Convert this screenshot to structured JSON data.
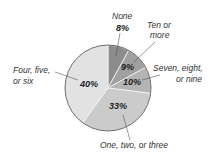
{
  "chart_data": {
    "type": "pie",
    "title": "",
    "start_angle_deg": 0,
    "direction": "clockwise",
    "slices": [
      {
        "label": "None",
        "value": 8,
        "pct_label": "8%",
        "color": "#8c8c8c"
      },
      {
        "label": "Ten or more",
        "value": 9,
        "pct_label": "9%",
        "color": "#a0a0a0"
      },
      {
        "label": "Seven, eight, or nine",
        "value": 10,
        "pct_label": "10%",
        "color": "#b4b4b4"
      },
      {
        "label": "One, two, or three",
        "value": 33,
        "pct_label": "33%",
        "color": "#cbcbcb"
      },
      {
        "label": "Four, five, or six",
        "value": 40,
        "pct_label": "40%",
        "color": "#e2e2e2"
      }
    ],
    "legend": "none (callout labels)",
    "grid": false
  },
  "labels": {
    "none": {
      "line1": "None",
      "pct": "8%"
    },
    "ten": {
      "line1": "Ten or",
      "line2": "more",
      "pct": "9%"
    },
    "seven": {
      "line1": "Seven, eight,",
      "line2": "or nine",
      "pct": "10%"
    },
    "one": {
      "line1": "One, two, or three",
      "pct": "33%"
    },
    "four": {
      "line1": "Four, five,",
      "line2": "or six",
      "pct": "40%"
    }
  }
}
